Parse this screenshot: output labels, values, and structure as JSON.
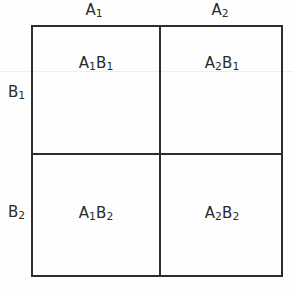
{
  "figure": {
    "background_color": "#fefefe",
    "line_color": "#2d2d2d",
    "text_color": "#2b2b2b"
  },
  "columns": [
    {
      "id": "A1",
      "base": "A",
      "sub": "1",
      "label": "A₁"
    },
    {
      "id": "A2",
      "base": "A",
      "sub": "2",
      "label": "A₂"
    }
  ],
  "rows": [
    {
      "id": "B1",
      "base": "B",
      "sub": "1",
      "label": "B₁"
    },
    {
      "id": "B2",
      "base": "B",
      "sub": "2",
      "label": "B₂"
    }
  ],
  "cells": [
    {
      "row": "B1",
      "col": "A1",
      "a_base": "A",
      "a_sub": "1",
      "b_base": "B",
      "b_sub": "1",
      "label": "A₁B₁"
    },
    {
      "row": "B1",
      "col": "A2",
      "a_base": "A",
      "a_sub": "2",
      "b_base": "B",
      "b_sub": "1",
      "label": "A₂B₁"
    },
    {
      "row": "B2",
      "col": "A1",
      "a_base": "A",
      "a_sub": "1",
      "b_base": "B",
      "b_sub": "2",
      "label": "A₁B₂"
    },
    {
      "row": "B2",
      "col": "A2",
      "a_base": "A",
      "a_sub": "2",
      "b_base": "B",
      "b_sub": "2",
      "label": "A₂B₂"
    }
  ]
}
